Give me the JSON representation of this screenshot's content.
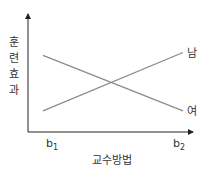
{
  "chart_data": {
    "type": "line",
    "title": "",
    "xlabel": "교수방법",
    "ylabel_chars": [
      "훈",
      "련",
      "효",
      "과"
    ],
    "ylabel": "훈련효과",
    "categories": [
      "b1",
      "b2"
    ],
    "category_labels": [
      {
        "base": "b",
        "sub": "1"
      },
      {
        "base": "b",
        "sub": "2"
      }
    ],
    "ylim": [
      0,
      100
    ],
    "grid": false,
    "series": [
      {
        "name": "남",
        "values": [
          14,
          76
        ]
      },
      {
        "name": "여",
        "values": [
          73,
          14
        ]
      }
    ],
    "legend": "inline-right",
    "colors": {
      "line": "#8a8a8a",
      "axis": "#222222"
    }
  }
}
